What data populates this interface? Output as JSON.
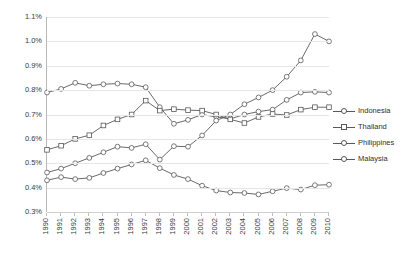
{
  "chart_data": {
    "type": "line",
    "title": "",
    "xlabel": "",
    "ylabel": "",
    "grid": true,
    "legend_position": "right",
    "ylim": [
      0.003,
      0.011
    ],
    "ytick_labels": [
      "1.1%",
      "1.0%",
      "0.9%",
      "0.8%",
      "0.7%",
      "0.6%",
      "0.5%",
      "0.4%",
      "0.3%"
    ],
    "ytick_values": [
      1.1,
      1.0,
      0.9,
      0.8,
      0.7,
      0.6,
      0.5,
      0.4,
      0.3
    ],
    "categories": [
      "1990",
      "1991",
      "1992",
      "1993",
      "1994",
      "1995",
      "1996",
      "1997",
      "1998",
      "1999",
      "2000",
      "2001",
      "2002",
      "2003",
      "2004",
      "2005",
      "2006",
      "2007",
      "2008",
      "2009",
      "2010"
    ],
    "series": [
      {
        "name": "Indonesia",
        "marker": "circle",
        "color": "#595959",
        "values": [
          0.79,
          0.805,
          0.83,
          0.818,
          0.824,
          0.827,
          0.824,
          0.812,
          0.73,
          0.662,
          0.678,
          0.7,
          0.69,
          0.682,
          0.7,
          0.712,
          0.72,
          0.76,
          0.79,
          0.793,
          0.79
        ]
      },
      {
        "name": "Thailand",
        "marker": "square",
        "color": "#595959",
        "values": [
          0.555,
          0.572,
          0.6,
          0.615,
          0.655,
          0.68,
          0.7,
          0.757,
          0.716,
          0.722,
          0.718,
          0.716,
          0.7,
          0.68,
          0.665,
          0.69,
          0.702,
          0.698,
          0.72,
          0.73,
          0.73
        ]
      },
      {
        "name": "Philippines",
        "marker": "circle",
        "color": "#595959",
        "values": [
          0.462,
          0.478,
          0.5,
          0.522,
          0.545,
          0.568,
          0.563,
          0.578,
          0.515,
          0.57,
          0.568,
          0.614,
          0.675,
          0.7,
          0.742,
          0.77,
          0.8,
          0.855,
          0.922,
          1.03,
          1.0
        ]
      },
      {
        "name": "Malaysia",
        "marker": "circle",
        "color": "#595959",
        "values": [
          0.43,
          0.443,
          0.435,
          0.44,
          0.46,
          0.478,
          0.495,
          0.512,
          0.48,
          0.452,
          0.435,
          0.408,
          0.388,
          0.38,
          0.378,
          0.372,
          0.385,
          0.398,
          0.392,
          0.41,
          0.412
        ]
      }
    ]
  }
}
